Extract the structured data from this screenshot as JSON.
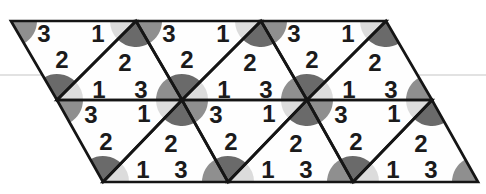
{
  "figure": {
    "canvas": {
      "width": 486,
      "height": 194
    },
    "colors": {
      "background": "#ffffff",
      "triangle_fill": "#fefefe",
      "outline": "#151515",
      "label": "#1b1b1b",
      "angle_1": "#dcdcdc",
      "angle_2": "#6a6a6a",
      "angle_3": "#8f8f8f",
      "scan_line": "#d9d9d9"
    },
    "stroke_width": 2.7,
    "sector_radius": 26,
    "scan_line": {
      "x1": 0,
      "y1": 75,
      "x2": 486,
      "y2": 75,
      "width": 1.6
    },
    "triangles": [
      {
        "name": "row1-down-1",
        "points": [
          [
            11,
            21
          ],
          [
            136,
            21
          ],
          [
            57,
            100
          ]
        ],
        "labels": [
          {
            "t": "3",
            "x": 44,
            "y": 33
          },
          {
            "t": "1",
            "x": 98,
            "y": 33
          },
          {
            "t": "2",
            "x": 62,
            "y": 59
          }
        ]
      },
      {
        "name": "row1-down-2",
        "points": [
          [
            136,
            21
          ],
          [
            261,
            21
          ],
          [
            182,
            100
          ]
        ],
        "labels": [
          {
            "t": "3",
            "x": 169,
            "y": 33
          },
          {
            "t": "1",
            "x": 223,
            "y": 33
          },
          {
            "t": "2",
            "x": 187,
            "y": 59
          }
        ]
      },
      {
        "name": "row1-down-3",
        "points": [
          [
            261,
            21
          ],
          [
            386,
            21
          ],
          [
            307,
            100
          ]
        ],
        "labels": [
          {
            "t": "3",
            "x": 294,
            "y": 33
          },
          {
            "t": "1",
            "x": 348,
            "y": 33
          },
          {
            "t": "2",
            "x": 312,
            "y": 59
          }
        ]
      },
      {
        "name": "row1-up-1",
        "points": [
          [
            57,
            100
          ],
          [
            182,
            100
          ],
          [
            136,
            21
          ]
        ],
        "labels": [
          {
            "t": "2",
            "x": 125,
            "y": 62
          },
          {
            "t": "1",
            "x": 99,
            "y": 89
          },
          {
            "t": "3",
            "x": 141,
            "y": 89
          }
        ]
      },
      {
        "name": "row1-up-2",
        "points": [
          [
            182,
            100
          ],
          [
            307,
            100
          ],
          [
            261,
            21
          ]
        ],
        "labels": [
          {
            "t": "2",
            "x": 250,
            "y": 62
          },
          {
            "t": "1",
            "x": 224,
            "y": 89
          },
          {
            "t": "3",
            "x": 266,
            "y": 89
          }
        ]
      },
      {
        "name": "row1-up-3",
        "points": [
          [
            307,
            100
          ],
          [
            432,
            100
          ],
          [
            386,
            21
          ]
        ],
        "labels": [
          {
            "t": "2",
            "x": 375,
            "y": 62
          },
          {
            "t": "1",
            "x": 349,
            "y": 89
          },
          {
            "t": "3",
            "x": 391,
            "y": 89
          }
        ]
      },
      {
        "name": "row2-down-1",
        "points": [
          [
            57,
            100
          ],
          [
            182,
            100
          ],
          [
            103,
            182
          ]
        ],
        "labels": [
          {
            "t": "3",
            "x": 91,
            "y": 114
          },
          {
            "t": "1",
            "x": 144,
            "y": 113
          },
          {
            "t": "2",
            "x": 106,
            "y": 141
          }
        ]
      },
      {
        "name": "row2-down-2",
        "points": [
          [
            182,
            100
          ],
          [
            307,
            100
          ],
          [
            228,
            182
          ]
        ],
        "labels": [
          {
            "t": "3",
            "x": 216,
            "y": 114
          },
          {
            "t": "1",
            "x": 269,
            "y": 113
          },
          {
            "t": "2",
            "x": 231,
            "y": 141
          }
        ]
      },
      {
        "name": "row2-down-3",
        "points": [
          [
            307,
            100
          ],
          [
            432,
            100
          ],
          [
            353,
            182
          ]
        ],
        "labels": [
          {
            "t": "3",
            "x": 341,
            "y": 114
          },
          {
            "t": "1",
            "x": 394,
            "y": 113
          },
          {
            "t": "2",
            "x": 356,
            "y": 141
          }
        ]
      },
      {
        "name": "row2-up-1",
        "points": [
          [
            103,
            182
          ],
          [
            228,
            182
          ],
          [
            182,
            100
          ]
        ],
        "labels": [
          {
            "t": "2",
            "x": 171,
            "y": 143
          },
          {
            "t": "1",
            "x": 143,
            "y": 169
          },
          {
            "t": "3",
            "x": 181,
            "y": 169
          }
        ]
      },
      {
        "name": "row2-up-2",
        "points": [
          [
            228,
            182
          ],
          [
            353,
            182
          ],
          [
            307,
            100
          ]
        ],
        "labels": [
          {
            "t": "2",
            "x": 296,
            "y": 143
          },
          {
            "t": "1",
            "x": 268,
            "y": 169
          },
          {
            "t": "3",
            "x": 306,
            "y": 169
          }
        ]
      },
      {
        "name": "row2-up-3",
        "points": [
          [
            353,
            182
          ],
          [
            478,
            182
          ],
          [
            432,
            100
          ]
        ],
        "labels": [
          {
            "t": "2",
            "x": 421,
            "y": 143
          },
          {
            "t": "1",
            "x": 393,
            "y": 169
          },
          {
            "t": "3",
            "x": 431,
            "y": 169
          }
        ]
      }
    ],
    "vertices": [
      {
        "x": 11,
        "y": 21,
        "sectors": [
          {
            "a": "3",
            "s": 0,
            "e": 60.3
          }
        ]
      },
      {
        "x": 136,
        "y": 21,
        "sectors": [
          {
            "a": "1",
            "s": 133.9,
            "e": 180
          },
          {
            "a": "2",
            "s": 60.3,
            "e": 133.9
          },
          {
            "a": "3",
            "s": 0,
            "e": 60.3
          }
        ]
      },
      {
        "x": 261,
        "y": 21,
        "sectors": [
          {
            "a": "1",
            "s": 133.9,
            "e": 180
          },
          {
            "a": "2",
            "s": 60.3,
            "e": 133.9
          },
          {
            "a": "3",
            "s": 0,
            "e": 60.3
          }
        ]
      },
      {
        "x": 386,
        "y": 21,
        "sectors": [
          {
            "a": "1",
            "s": 133.9,
            "e": 180
          },
          {
            "a": "2",
            "s": 60.3,
            "e": 133.9
          }
        ]
      },
      {
        "x": 57,
        "y": 100,
        "sectors": [
          {
            "a": "2",
            "s": 240.3,
            "e": 313.9
          },
          {
            "a": "1",
            "s": 313.9,
            "e": 360
          },
          {
            "a": "3",
            "s": 0,
            "e": 60.3
          }
        ]
      },
      {
        "x": 182,
        "y": 100,
        "sectors": [
          {
            "a": "3",
            "s": 180,
            "e": 240.3
          },
          {
            "a": "2",
            "s": 240.3,
            "e": 313.9
          },
          {
            "a": "1",
            "s": 313.9,
            "e": 360
          },
          {
            "a": "3",
            "s": 0,
            "e": 60.3
          },
          {
            "a": "2",
            "s": 60.3,
            "e": 133.9
          },
          {
            "a": "1",
            "s": 133.9,
            "e": 180
          }
        ]
      },
      {
        "x": 307,
        "y": 100,
        "sectors": [
          {
            "a": "3",
            "s": 180,
            "e": 240.3
          },
          {
            "a": "2",
            "s": 240.3,
            "e": 313.9
          },
          {
            "a": "1",
            "s": 313.9,
            "e": 360
          },
          {
            "a": "3",
            "s": 0,
            "e": 60.3
          },
          {
            "a": "2",
            "s": 60.3,
            "e": 133.9
          },
          {
            "a": "1",
            "s": 133.9,
            "e": 180
          }
        ]
      },
      {
        "x": 432,
        "y": 100,
        "sectors": [
          {
            "a": "3",
            "s": 180,
            "e": 240.3
          },
          {
            "a": "1",
            "s": 133.9,
            "e": 180
          },
          {
            "a": "2",
            "s": 60.3,
            "e": 133.9
          }
        ]
      },
      {
        "x": 103,
        "y": 182,
        "sectors": [
          {
            "a": "2",
            "s": 240.3,
            "e": 313.9
          },
          {
            "a": "1",
            "s": 313.9,
            "e": 360
          }
        ]
      },
      {
        "x": 228,
        "y": 182,
        "sectors": [
          {
            "a": "3",
            "s": 180,
            "e": 240.3
          },
          {
            "a": "2",
            "s": 240.3,
            "e": 313.9
          },
          {
            "a": "1",
            "s": 313.9,
            "e": 360
          }
        ]
      },
      {
        "x": 353,
        "y": 182,
        "sectors": [
          {
            "a": "3",
            "s": 180,
            "e": 240.3
          },
          {
            "a": "2",
            "s": 240.3,
            "e": 313.9
          },
          {
            "a": "1",
            "s": 313.9,
            "e": 360
          }
        ]
      },
      {
        "x": 478,
        "y": 182,
        "sectors": [
          {
            "a": "3",
            "s": 180,
            "e": 240.3
          }
        ]
      }
    ]
  }
}
